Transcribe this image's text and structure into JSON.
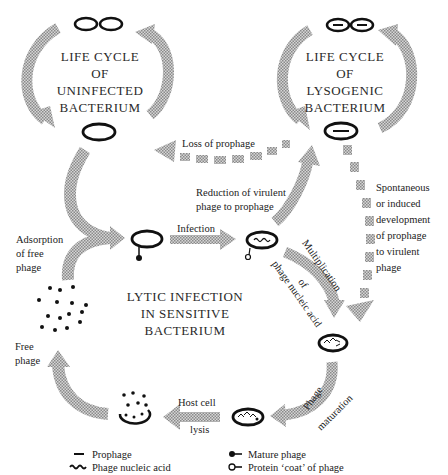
{
  "diagram": {
    "titles": {
      "uninfected": [
        "LIFE CYCLE",
        "OF",
        "UNINFECTED",
        "BACTERIUM"
      ],
      "lysogenic": [
        "LIFE CYCLE",
        "OF",
        "LYSOGENIC",
        "BACTERIUM"
      ],
      "lytic": [
        "LYTIC INFECTION",
        "IN SENSITIVE",
        "BACTERIUM"
      ]
    },
    "labels": {
      "loss_of_prophage": "Loss of prophage",
      "reduction": [
        "Reduction of virulent",
        "phage to prophage"
      ],
      "spontaneous": [
        "Spontaneous",
        "or induced",
        "development",
        "of prophage",
        "to virulent",
        "phage"
      ],
      "adsorption": [
        "Adsorption",
        "of free",
        "phage"
      ],
      "infection": "Infection",
      "multiplication": "Multiplication",
      "of": "of",
      "phage_nucleic_acid": "phage nucleic acid",
      "free_phage": [
        "Free",
        "phage"
      ],
      "host_cell": "Host cell",
      "lysis": "lysis",
      "phage": "Phage",
      "maturation": "maturation"
    },
    "legend": [
      {
        "icon": "prophage-icon",
        "label": "Prophage"
      },
      {
        "icon": "phage-nucleic-acid-icon",
        "label": "Phage nucleic acid"
      },
      {
        "icon": "mature-phage-icon",
        "label": "Mature phage"
      },
      {
        "icon": "protein-coat-icon",
        "label": "Protein ‘coat’ of phage"
      }
    ],
    "colors": {
      "arrow_fill": "#b8b8b8",
      "outline": "#111111"
    }
  }
}
